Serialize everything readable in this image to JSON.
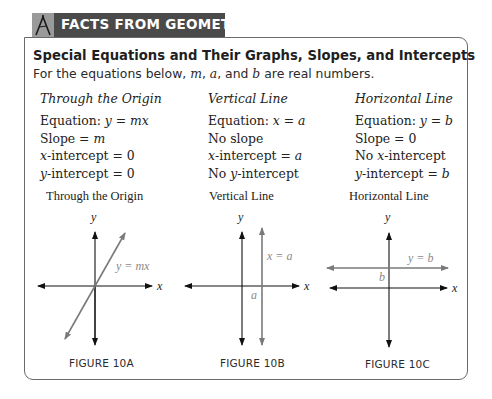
{
  "banner": {
    "icon": "geometry-compass-icon",
    "title": "FACTS FROM GEOMETRY"
  },
  "box": {
    "title": "Special Equations and Their Graphs, Slopes, and Intercepts",
    "subtitle_prefix": "For the equations below, ",
    "subtitle_m": "m",
    "subtitle_sep1": ", ",
    "subtitle_a": "a",
    "subtitle_sep2": ", and ",
    "subtitle_b": "b",
    "subtitle_suffix": " are real numbers."
  },
  "columns": [
    {
      "heading": "Through the Origin",
      "lines": [
        {
          "text": "Equation: ",
          "math": "y = mx"
        },
        {
          "text": "Slope = ",
          "math": "m"
        },
        {
          "math_prefix": "x",
          "text": "-intercept = 0"
        },
        {
          "math_prefix": "y",
          "text": "-intercept = 0"
        }
      ]
    },
    {
      "heading": "Vertical Line",
      "lines": [
        {
          "text": "Equation: ",
          "math": "x = a"
        },
        {
          "text": "No slope"
        },
        {
          "math_prefix": "x",
          "text": "-intercept = ",
          "math": "a"
        },
        {
          "text": "No ",
          "math_mid": "y",
          "text2": "-intercept"
        }
      ]
    },
    {
      "heading": "Horizontal Line",
      "lines": [
        {
          "text": "Equation: ",
          "math": "y = b"
        },
        {
          "text": "Slope = 0"
        },
        {
          "text": "No ",
          "math_mid": "x",
          "text2": "-intercept"
        },
        {
          "math_prefix": "y",
          "text": "-intercept = ",
          "math": "b"
        }
      ]
    }
  ],
  "figures": [
    {
      "title": "Through the Origin",
      "label": "FIGURE 10A",
      "x_axis_label": "x",
      "y_axis_label": "y",
      "line_label": "y = mx"
    },
    {
      "title": "Vertical Line",
      "label": "FIGURE 10B",
      "x_axis_label": "x",
      "y_axis_label": "y",
      "line_label": "x = a",
      "intercept_label": "a"
    },
    {
      "title": "Horizontal Line",
      "label": "FIGURE 10C",
      "x_axis_label": "x",
      "y_axis_label": "y",
      "line_label": "y = b",
      "intercept_label": "b"
    }
  ],
  "colors": {
    "banner_bg": "#4a4a4a",
    "banner_text": "#ffffff",
    "box_border": "#6a6a6a",
    "axis": "#111111",
    "graph_line": "#7a7a7a",
    "graph_label": "#8a8a8a"
  }
}
